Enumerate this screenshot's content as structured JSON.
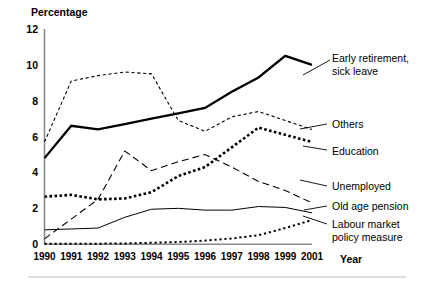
{
  "chart_data": {
    "type": "line",
    "title": "",
    "ylabel": "Percentage",
    "xlabel": "Year",
    "ylim": [
      0,
      12
    ],
    "yticks": [
      0,
      2,
      4,
      6,
      8,
      10,
      12
    ],
    "grid": false,
    "legend_position": "right-inline",
    "categories": [
      "1990",
      "1991",
      "1992",
      "1993",
      "1994",
      "1995",
      "1996",
      "1997",
      "1998",
      "1999",
      "2001"
    ],
    "series": [
      {
        "name": "Early retirement, sick leave",
        "style": "solid-thick",
        "values": [
          4.8,
          6.6,
          6.4,
          6.7,
          7.0,
          7.3,
          7.6,
          8.5,
          9.3,
          10.5,
          10.0
        ]
      },
      {
        "name": "Others",
        "style": "dashed-fine",
        "values": [
          5.7,
          9.1,
          9.4,
          9.6,
          9.5,
          6.9,
          6.3,
          7.1,
          7.4,
          6.9,
          6.4
        ]
      },
      {
        "name": "Education",
        "style": "dotted-thick",
        "values": [
          2.65,
          2.75,
          2.5,
          2.55,
          2.9,
          3.8,
          4.3,
          5.4,
          6.5,
          6.1,
          5.7
        ]
      },
      {
        "name": "Unemployed",
        "style": "dashed-long",
        "values": [
          0.3,
          1.4,
          2.5,
          5.2,
          4.1,
          4.6,
          5.0,
          4.3,
          3.5,
          3.0,
          2.3
        ]
      },
      {
        "name": "Old age pension",
        "style": "solid-thin",
        "values": [
          0.8,
          0.85,
          0.9,
          1.5,
          1.95,
          2.0,
          1.9,
          1.9,
          2.1,
          2.05,
          1.75
        ]
      },
      {
        "name": "Labour market policy measure",
        "style": "dotted-fine",
        "values": [
          0.02,
          0.02,
          0.03,
          0.04,
          0.08,
          0.12,
          0.2,
          0.32,
          0.5,
          0.9,
          1.35
        ]
      }
    ],
    "legend": [
      {
        "label_line1": "Early retirement,",
        "label_line2": "sick leave"
      },
      {
        "label_line1": "Others",
        "label_line2": ""
      },
      {
        "label_line1": "Education",
        "label_line2": ""
      },
      {
        "label_line1": "Unemployed",
        "label_line2": ""
      },
      {
        "label_line1": "Old age pension",
        "label_line2": ""
      },
      {
        "label_line1": "Labour market",
        "label_line2": "policy measure"
      }
    ]
  }
}
